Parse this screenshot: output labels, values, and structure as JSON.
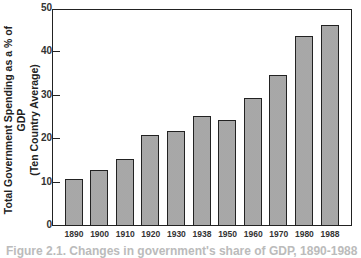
{
  "chart_data": {
    "type": "bar",
    "title": "",
    "xlabel": "",
    "ylabel": "Total Government Spending as a % of GDP (Ten Country Average)",
    "ylabel_lines": [
      "Total Government Spending as a % of GDP",
      "(Ten Country Average)"
    ],
    "categories": [
      "1890",
      "1900",
      "1910",
      "1920",
      "1930",
      "1938",
      "1950",
      "1960",
      "1970",
      "1980",
      "1988"
    ],
    "values": [
      11,
      13,
      15.5,
      21,
      22,
      25.5,
      24.5,
      29.5,
      35,
      44,
      46.5
    ],
    "ylim": [
      0,
      50
    ],
    "yticks": [
      0,
      10,
      20,
      30,
      40,
      50
    ],
    "grid": false,
    "legend": null,
    "bar_fill": "stippled gray"
  },
  "caption": "Figure 2.1. Changes in government's share of GDP, 1890-1988"
}
